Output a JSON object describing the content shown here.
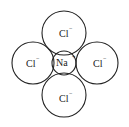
{
  "diagram": {
    "center_ion": {
      "symbol": "Na",
      "charge": "+"
    },
    "surrounding_ions": [
      {
        "position": "top",
        "symbol": "Cl",
        "charge": "−"
      },
      {
        "position": "left",
        "symbol": "Cl",
        "charge": "−"
      },
      {
        "position": "right",
        "symbol": "Cl",
        "charge": "−"
      },
      {
        "position": "bottom",
        "symbol": "Cl",
        "charge": "−"
      }
    ]
  }
}
